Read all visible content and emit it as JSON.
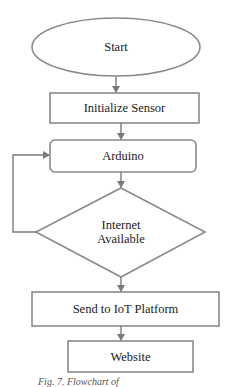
{
  "diagram": {
    "type": "flowchart",
    "colors": {
      "stroke": "#8a8a8a",
      "text": "#1a1a1a",
      "background": "#ffffff"
    },
    "nodes": [
      {
        "id": "start",
        "shape": "ellipse",
        "label": "Start"
      },
      {
        "id": "init",
        "shape": "rectangle",
        "label": "Initialize Sensor"
      },
      {
        "id": "arduino",
        "shape": "rounded-rectangle",
        "label": "Arduino"
      },
      {
        "id": "internet",
        "shape": "diamond",
        "label_line1": "Internet",
        "label_line2": "Available"
      },
      {
        "id": "send",
        "shape": "rectangle",
        "label": "Send to IoT Platform"
      },
      {
        "id": "website",
        "shape": "rectangle",
        "label": "Website"
      }
    ],
    "edges": [
      {
        "from": "start",
        "to": "init"
      },
      {
        "from": "init",
        "to": "arduino"
      },
      {
        "from": "arduino",
        "to": "internet"
      },
      {
        "from": "internet",
        "to": "arduino",
        "note": "loop back (left side)"
      },
      {
        "from": "internet",
        "to": "send"
      },
      {
        "from": "send",
        "to": "website"
      }
    ],
    "caption": "Fig. 7. Flowchart of"
  }
}
